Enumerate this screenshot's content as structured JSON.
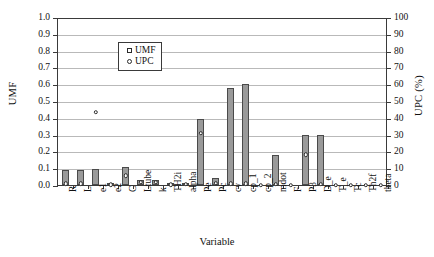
{
  "chart_data": {
    "type": "bar",
    "title": "",
    "xlabel": "Variable",
    "ylabel": "UMF",
    "y2label": "UPC (%)",
    "ylim": [
      0,
      1.0
    ],
    "y2lim": [
      0,
      100
    ],
    "grid": true,
    "legend_position": "top-left",
    "yticks": [
      "0.0",
      "0.1",
      "0.2",
      "0.3",
      "0.4",
      "0.5",
      "0.6",
      "0.7",
      "0.8",
      "0.9",
      "1.0"
    ],
    "y2ticks": [
      "0",
      "10",
      "20",
      "30",
      "40",
      "50",
      "60",
      "70",
      "80",
      "90",
      "100"
    ],
    "categories": [
      "R",
      "L",
      "e1",
      "e2",
      "C",
      "Ltube",
      "k",
      "TH2i",
      "alpha",
      "Pe",
      "Pc",
      "cv",
      "cp_1",
      "cp_2",
      "mdot",
      "F",
      "P3",
      "D_e",
      "T_e",
      "Tc",
      "Th2f",
      "theta"
    ],
    "series": [
      {
        "name": "UMF",
        "marker": "square",
        "axis": "left",
        "values": [
          0.092,
          0.092,
          0.098,
          0.008,
          0.11,
          0.03,
          0.03,
          0.008,
          0.01,
          0.395,
          0.04,
          0.578,
          0.6,
          0.0,
          0.18,
          0.0,
          0.3,
          0.3,
          0.0,
          0.0,
          0.0,
          0.0
        ]
      },
      {
        "name": "UPC",
        "marker": "circle",
        "axis": "right",
        "values": [
          0.8,
          0.8,
          43.5,
          0.3,
          5.5,
          1.5,
          1.5,
          0.3,
          0.4,
          31.0,
          1.0,
          0.8,
          0.8,
          0.0,
          0.6,
          0.0,
          18.0,
          0.6,
          0.0,
          0.0,
          0.0,
          0.0
        ]
      }
    ],
    "legend": [
      {
        "label": "UMF",
        "marker": "square"
      },
      {
        "label": "UPC",
        "marker": "circle"
      }
    ],
    "colors": {
      "bar_fill": "#9a9a9a",
      "bar_stroke": "#4a4a4a",
      "grid": "#b9b9b9",
      "axis": "#3a3a3a",
      "marker_stroke": "#2b2b2b",
      "marker_fill": "#ffffff"
    }
  }
}
